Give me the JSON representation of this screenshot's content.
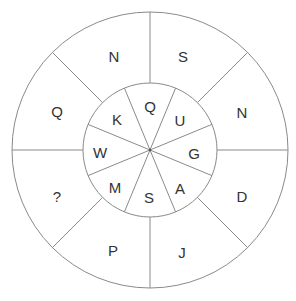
{
  "puzzle": {
    "outer_ring": [
      {
        "position": "top-left",
        "letter": "N"
      },
      {
        "position": "top-right",
        "letter": "S"
      },
      {
        "position": "right-upper",
        "letter": "N"
      },
      {
        "position": "right-lower",
        "letter": "D"
      },
      {
        "position": "bottom-right",
        "letter": "J"
      },
      {
        "position": "bottom-left",
        "letter": "P"
      },
      {
        "position": "left-lower",
        "letter": "?"
      },
      {
        "position": "left-upper",
        "letter": "Q"
      }
    ],
    "inner_ring": [
      {
        "position": "top",
        "letter": "Q"
      },
      {
        "position": "top-right",
        "letter": "U"
      },
      {
        "position": "right",
        "letter": "G"
      },
      {
        "position": "bottom-right",
        "letter": "A"
      },
      {
        "position": "bottom",
        "letter": "S"
      },
      {
        "position": "bottom-left",
        "letter": "M"
      },
      {
        "position": "left",
        "letter": "W"
      },
      {
        "position": "top-left",
        "letter": "K"
      }
    ]
  },
  "colors": {
    "line": "#8a8a8a",
    "text": "#333333",
    "background": "#ffffff"
  }
}
